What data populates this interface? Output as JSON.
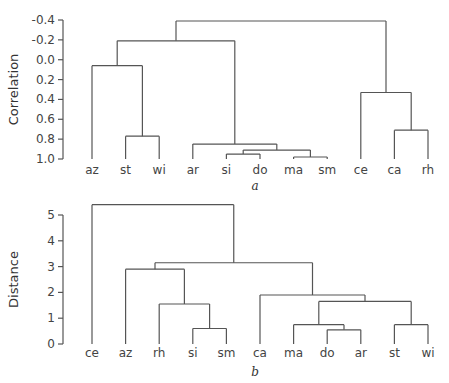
{
  "chart_data": [
    {
      "type": "dendrogram",
      "panel_label": "a",
      "ylabel": "Correlation",
      "y_inverted": true,
      "ylim": [
        -0.4,
        1.0
      ],
      "yticks": [
        -0.4,
        -0.2,
        0.0,
        0.2,
        0.4,
        0.6,
        0.8,
        1.0
      ],
      "ytick_labels": [
        "-0.4",
        "-0.2",
        "0.0",
        "0.2",
        "0.4",
        "0.6",
        "0.8",
        "1.0"
      ],
      "leaves": [
        "az",
        "st",
        "wi",
        "ar",
        "si",
        "do",
        "ma",
        "sm",
        "ce",
        "ca",
        "rh"
      ],
      "merges": [
        {
          "id": "m1",
          "left": "st",
          "right": "wi",
          "height": 0.77
        },
        {
          "id": "m2",
          "left": "az",
          "right": "m1",
          "height": 0.06
        },
        {
          "id": "m3",
          "left": "si",
          "right": "do",
          "height": 0.95
        },
        {
          "id": "m4",
          "left": "ma",
          "right": "sm",
          "height": 0.98
        },
        {
          "id": "m5",
          "left": "m3",
          "right": "m4",
          "height": 0.91
        },
        {
          "id": "m6",
          "left": "ar",
          "right": "m5",
          "height": 0.85
        },
        {
          "id": "m7",
          "left": "m2",
          "right": "m6",
          "height": -0.19
        },
        {
          "id": "m8",
          "left": "ca",
          "right": "rh",
          "height": 0.71
        },
        {
          "id": "m9",
          "left": "ce",
          "right": "m8",
          "height": 0.33
        },
        {
          "id": "m10",
          "left": "m7",
          "right": "m9",
          "height": -0.39
        }
      ]
    },
    {
      "type": "dendrogram",
      "panel_label": "b",
      "ylabel": "Distance",
      "y_inverted": false,
      "ylim": [
        0,
        5
      ],
      "yticks": [
        0,
        1,
        2,
        3,
        4,
        5
      ],
      "ytick_labels": [
        "0",
        "1",
        "2",
        "3",
        "4",
        "5"
      ],
      "leaves": [
        "ce",
        "az",
        "rh",
        "si",
        "sm",
        "ca",
        "ma",
        "do",
        "ar",
        "st",
        "wi"
      ],
      "merges": [
        {
          "id": "n1",
          "left": "si",
          "right": "sm",
          "height": 0.6
        },
        {
          "id": "n2",
          "left": "rh",
          "right": "n1",
          "height": 1.55
        },
        {
          "id": "n3",
          "left": "az",
          "right": "n2",
          "height": 2.9
        },
        {
          "id": "n4",
          "left": "do",
          "right": "ar",
          "height": 0.55
        },
        {
          "id": "n5",
          "left": "ma",
          "right": "n4",
          "height": 0.75
        },
        {
          "id": "n6",
          "left": "st",
          "right": "wi",
          "height": 0.75
        },
        {
          "id": "n7",
          "left": "n5",
          "right": "n6",
          "height": 1.65
        },
        {
          "id": "n8",
          "left": "ca",
          "right": "n7",
          "height": 1.9
        },
        {
          "id": "n9",
          "left": "n3",
          "right": "n8",
          "height": 3.15
        },
        {
          "id": "n10",
          "left": "ce",
          "right": "n9",
          "height": 5.4
        }
      ]
    }
  ]
}
